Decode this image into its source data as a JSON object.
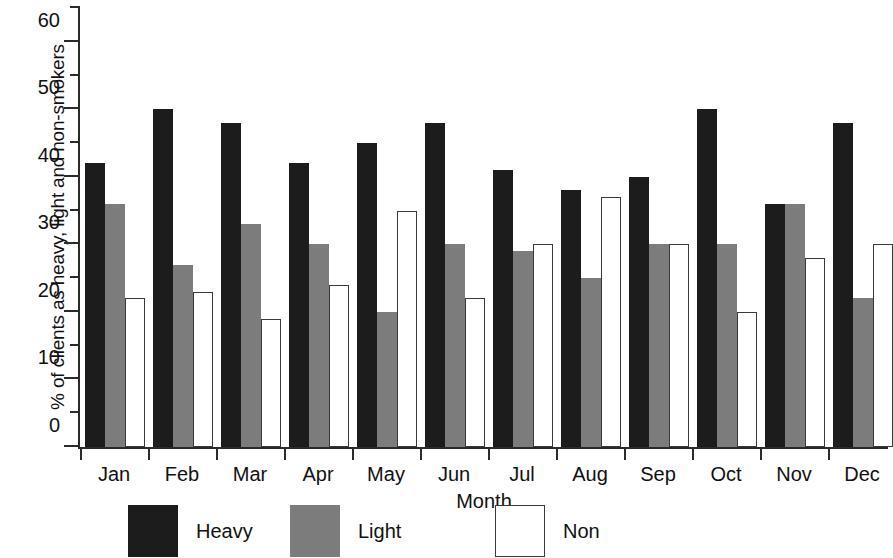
{
  "chart_data": {
    "type": "bar",
    "title": "",
    "xlabel": "Month",
    "ylabel": "% of clients as heavy, light and non-smokers",
    "categories": [
      "Jan",
      "Feb",
      "Mar",
      "Apr",
      "May",
      "Jun",
      "Jul",
      "Aug",
      "Sep",
      "Oct",
      "Nov",
      "Dec"
    ],
    "series": [
      {
        "name": "Heavy",
        "color": "#1c1c1c",
        "values": [
          42,
          50,
          48,
          42,
          45,
          48,
          41,
          38,
          40,
          50,
          36,
          48
        ]
      },
      {
        "name": "Light",
        "color": "#7c7c7c",
        "values": [
          36,
          27,
          33,
          30,
          20,
          30,
          29,
          25,
          30,
          30,
          36,
          22
        ]
      },
      {
        "name": "Non",
        "color": "#ffffff",
        "values": [
          22,
          23,
          19,
          24,
          35,
          22,
          30,
          37,
          30,
          20,
          28,
          30
        ]
      }
    ],
    "ylim": [
      0,
      65
    ],
    "ytick_major": [
      0,
      10,
      20,
      30,
      40,
      50,
      60
    ],
    "ytick_major_labels": [
      "0",
      "10",
      "20",
      "30",
      "40",
      "50",
      "60"
    ],
    "ytick_minor": [
      5,
      15,
      25,
      35,
      45,
      55,
      65
    ],
    "grid": false,
    "legend_position": "bottom",
    "note": "Dec Non bar is clipped by the right edge of the figure"
  },
  "legend": {
    "items": [
      {
        "label": "Heavy",
        "swatch": "heavy"
      },
      {
        "label": "Light",
        "swatch": "light"
      },
      {
        "label": "Non",
        "swatch": "non"
      }
    ]
  }
}
